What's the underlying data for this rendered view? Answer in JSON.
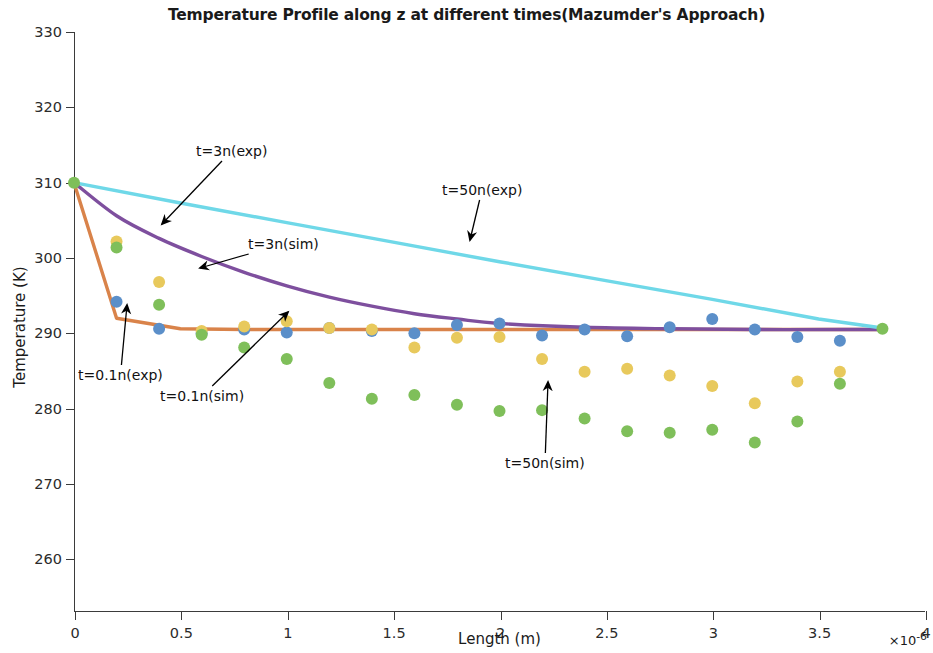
{
  "chart_data": {
    "type": "scatter",
    "title": "Temperature Profile along z at different times(Mazumder's Approach)",
    "xlabel": "Length (m)",
    "ylabel": "Temperature (K)",
    "x_multiplier": "×10",
    "x_multiplier_exp": "-6",
    "xlim": [
      0,
      4
    ],
    "ylim": [
      253,
      330
    ],
    "xticks": [
      "0",
      "0.5",
      "1",
      "1.5",
      "2",
      "2.5",
      "3",
      "3.5",
      "4"
    ],
    "xtick_values": [
      0,
      0.5,
      1,
      1.5,
      2,
      2.5,
      3,
      3.5,
      4
    ],
    "yticks": [
      "260",
      "270",
      "280",
      "290",
      "300",
      "310",
      "320",
      "330"
    ],
    "ytick_values": [
      260,
      270,
      280,
      290,
      300,
      310,
      320,
      330
    ],
    "grid": false,
    "legend": "none (in-plot arrow annotations)",
    "series": [
      {
        "name": "t=0.1n(exp)",
        "kind": "line",
        "color": "#D9834A",
        "x": [
          0,
          0.2,
          0.5,
          0.8,
          1.2,
          1.6,
          2.0,
          2.4,
          2.8,
          3.2,
          3.6,
          3.8
        ],
        "values": [
          310.0,
          292.0,
          290.6,
          290.5,
          290.5,
          290.5,
          290.5,
          290.5,
          290.5,
          290.5,
          290.5,
          290.5
        ]
      },
      {
        "name": "t=3n(exp)",
        "kind": "line",
        "color": "#7E4F9E",
        "x": [
          0,
          0.2,
          0.4,
          0.6,
          0.8,
          1.0,
          1.2,
          1.4,
          1.6,
          1.8,
          2.0,
          2.4,
          2.8,
          3.2,
          3.6,
          3.8
        ],
        "values": [
          310.0,
          305.6,
          302.6,
          300.2,
          298.1,
          296.3,
          294.8,
          293.6,
          292.6,
          291.9,
          291.3,
          290.8,
          290.6,
          290.5,
          290.5,
          290.5
        ]
      },
      {
        "name": "t=50n(exp)",
        "kind": "line",
        "color": "#6FD8E8",
        "x": [
          0,
          0.5,
          1.0,
          1.5,
          2.0,
          2.5,
          3.0,
          3.5,
          3.8
        ],
        "values": [
          310.0,
          307.3,
          304.7,
          302.1,
          299.5,
          297.0,
          294.5,
          291.9,
          290.7
        ]
      },
      {
        "name": "t=0.1n(sim)",
        "kind": "scatter",
        "color": "#5B8FC9",
        "x": [
          0.2,
          0.4,
          0.6,
          0.8,
          1.0,
          1.2,
          1.4,
          1.6,
          1.8,
          2.0,
          2.2,
          2.4,
          2.6,
          2.8,
          3.0,
          3.2,
          3.4,
          3.6
        ],
        "values": [
          294.2,
          290.6,
          290.0,
          290.5,
          290.1,
          290.7,
          290.3,
          290.0,
          291.1,
          291.3,
          289.7,
          290.5,
          289.6,
          290.8,
          291.9,
          290.5,
          289.5,
          289.0
        ]
      },
      {
        "name": "t=3n(sim)",
        "kind": "scatter",
        "color": "#E8C95C",
        "x": [
          0.2,
          0.4,
          0.6,
          0.8,
          1.0,
          1.2,
          1.4,
          1.6,
          1.8,
          2.0,
          2.2,
          2.4,
          2.6,
          2.8,
          3.0,
          3.2,
          3.4,
          3.6
        ],
        "values": [
          302.2,
          296.8,
          290.3,
          290.9,
          291.6,
          290.7,
          290.5,
          288.1,
          289.4,
          289.5,
          286.6,
          284.9,
          285.3,
          284.4,
          283.0,
          280.7,
          283.6,
          284.9
        ]
      },
      {
        "name": "t=50n(sim)",
        "kind": "scatter",
        "color": "#7FBF5A",
        "x": [
          0.2,
          0.4,
          0.6,
          0.8,
          1.0,
          1.2,
          1.4,
          1.6,
          1.8,
          2.0,
          2.2,
          2.4,
          2.6,
          2.8,
          3.0,
          3.2,
          3.4,
          3.6
        ],
        "values": [
          301.4,
          293.8,
          289.8,
          288.1,
          286.6,
          283.4,
          281.3,
          281.8,
          280.5,
          279.7,
          279.8,
          278.7,
          277.0,
          276.8,
          277.2,
          275.5,
          278.3,
          283.3
        ]
      }
    ],
    "annotations": [
      {
        "text": "t=3n(exp)",
        "label_x": 196,
        "label_y": 143,
        "tip_x": 162,
        "tip_y": 224
      },
      {
        "text": "t=50n(exp)",
        "label_x": 442,
        "label_y": 182,
        "tip_x": 470,
        "tip_y": 240
      },
      {
        "text": "t=3n(sim)",
        "label_x": 248,
        "label_y": 236,
        "tip_x": 200,
        "tip_y": 268
      },
      {
        "text": "t=0.1n(exp)",
        "label_x": 78,
        "label_y": 367,
        "tip_x": 127,
        "tip_y": 305
      },
      {
        "text": "t=0.1n(sim)",
        "label_x": 160,
        "label_y": 388,
        "tip_x": 288,
        "tip_y": 312
      },
      {
        "text": "t=50n(sim)",
        "label_x": 505,
        "label_y": 455,
        "tip_x": 548,
        "tip_y": 382
      }
    ]
  }
}
